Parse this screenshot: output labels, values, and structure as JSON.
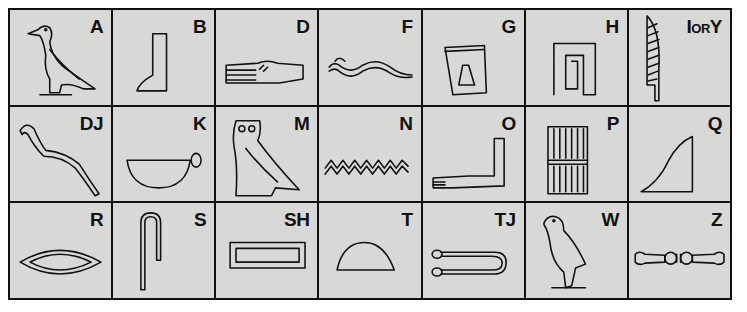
{
  "cells": [
    {
      "letter": "A",
      "glyph": "vulture-icon"
    },
    {
      "letter": "B",
      "glyph": "foot-icon"
    },
    {
      "letter": "D",
      "glyph": "hand-icon"
    },
    {
      "letter": "F",
      "glyph": "horned-viper-icon"
    },
    {
      "letter": "G",
      "glyph": "jar-stand-icon"
    },
    {
      "letter": "H",
      "glyph": "twisted-wick-icon"
    },
    {
      "letter": "I",
      "letter_mid": "OR",
      "letter_end": "Y",
      "glyph": "reed-leaf-icon"
    },
    {
      "letter": "DJ",
      "glyph": "cobra-icon"
    },
    {
      "letter": "K",
      "glyph": "basket-icon"
    },
    {
      "letter": "M",
      "glyph": "owl-icon"
    },
    {
      "letter": "N",
      "glyph": "water-icon"
    },
    {
      "letter": "O",
      "glyph": "forearm-icon"
    },
    {
      "letter": "P",
      "glyph": "stool-icon"
    },
    {
      "letter": "Q",
      "glyph": "hill-slope-icon"
    },
    {
      "letter": "R",
      "glyph": "mouth-icon"
    },
    {
      "letter": "S",
      "glyph": "folded-cloth-icon"
    },
    {
      "letter": "SH",
      "glyph": "pool-icon"
    },
    {
      "letter": "T",
      "glyph": "bread-loaf-icon"
    },
    {
      "letter": "TJ",
      "glyph": "tethering-rope-icon"
    },
    {
      "letter": "W",
      "glyph": "quail-chick-icon"
    },
    {
      "letter": "Z",
      "glyph": "door-bolt-icon"
    }
  ]
}
